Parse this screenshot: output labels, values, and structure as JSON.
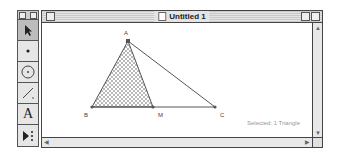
{
  "window": {
    "title": "Untitled 1",
    "status_text": "Selected: 1 Triangle"
  },
  "palette": {
    "tools": [
      {
        "name": "selection-arrow-tool",
        "glyph": "arrow",
        "active": true
      },
      {
        "name": "point-tool",
        "glyph": "•",
        "active": false
      },
      {
        "name": "compass-tool",
        "glyph": "circle",
        "active": false
      },
      {
        "name": "straightedge-tool",
        "glyph": "line",
        "active": false
      },
      {
        "name": "text-tool",
        "glyph": "A",
        "active": false
      },
      {
        "name": "custom-tool",
        "glyph": "▶⁝",
        "active": false
      }
    ]
  },
  "figure": {
    "points": [
      {
        "label": "A",
        "x": 86,
        "y": 18
      },
      {
        "label": "B",
        "x": 50,
        "y": 84
      },
      {
        "label": "M",
        "x": 111,
        "y": 84
      },
      {
        "label": "C",
        "x": 173,
        "y": 84
      }
    ],
    "shaded_triangle": [
      "A",
      "B",
      "M"
    ],
    "segments": [
      [
        "A",
        "B"
      ],
      [
        "A",
        "C"
      ],
      [
        "B",
        "C"
      ],
      [
        "A",
        "M"
      ]
    ],
    "colors": {
      "line": "#555555",
      "hatch": "#888888"
    }
  },
  "labels": {
    "A": "A",
    "B": "B",
    "M": "M",
    "C": "C",
    "text_tool": "A"
  }
}
